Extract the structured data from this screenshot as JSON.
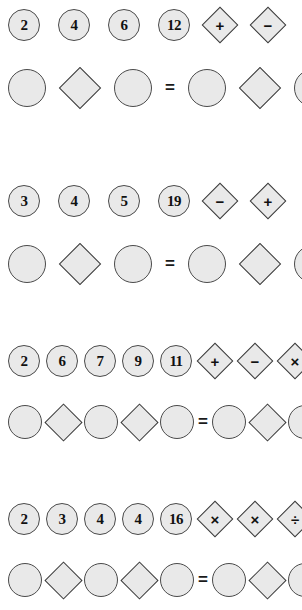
{
  "page": {
    "background_color": "#ffffff",
    "shape_fill_color": "#e9e9e9",
    "shape_stroke_color": "#4a4a4a",
    "glyph_color": "#111111",
    "equals_symbol": "=",
    "blank_label": ""
  },
  "puzzles": [
    {
      "id": "puzzle-1",
      "numbers": [
        "2",
        "4",
        "6",
        "12"
      ],
      "operators": [
        "+",
        "−"
      ],
      "answer_row": {
        "left": [
          "circle",
          "diamond",
          "circle"
        ],
        "equals": "=",
        "right": [
          "circle",
          "diamond",
          "circle"
        ]
      }
    },
    {
      "id": "puzzle-2",
      "numbers": [
        "3",
        "4",
        "5",
        "19"
      ],
      "operators": [
        "−",
        "+"
      ],
      "answer_row": {
        "left": [
          "circle",
          "diamond",
          "circle"
        ],
        "equals": "=",
        "right": [
          "circle",
          "diamond",
          "circle"
        ]
      }
    },
    {
      "id": "puzzle-3",
      "numbers": [
        "2",
        "6",
        "7",
        "9",
        "11"
      ],
      "operators": [
        "+",
        "−",
        "×"
      ],
      "answer_row": {
        "left": [
          "circle",
          "diamond",
          "circle",
          "diamond",
          "circle"
        ],
        "equals": "=",
        "right": [
          "circle",
          "diamond",
          "circle"
        ]
      }
    },
    {
      "id": "puzzle-4",
      "numbers": [
        "2",
        "3",
        "4",
        "4",
        "16"
      ],
      "operators": [
        "×",
        "×",
        "÷"
      ],
      "answer_row": {
        "left": [
          "circle",
          "diamond",
          "circle",
          "diamond",
          "circle"
        ],
        "equals": "=",
        "right": [
          "circle",
          "diamond",
          "circle"
        ]
      }
    }
  ]
}
